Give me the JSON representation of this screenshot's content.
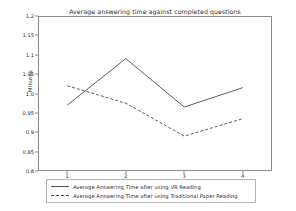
{
  "chart_data": {
    "type": "line",
    "title": "Average answering time against completed questions",
    "xlabel": "",
    "ylabel": "Minutes",
    "x": [
      1,
      2,
      3,
      4
    ],
    "categories": [
      "1",
      "2",
      "3",
      "4"
    ],
    "xtick_labels": [
      "1",
      "2",
      "3",
      "4"
    ],
    "ytick_labels": [
      "1.2",
      "1.15",
      "1.1",
      "1.05",
      "1.0",
      "0.95",
      "0.9",
      "0.85",
      "0.8"
    ],
    "ytick_values": [
      1.2,
      1.15,
      1.1,
      1.05,
      1.0,
      0.95,
      0.9,
      0.85,
      0.8
    ],
    "ylim": [
      0.8,
      1.2
    ],
    "xlim": [
      0.5,
      4.5
    ],
    "grid": false,
    "legend_position": "below-axes",
    "series": [
      {
        "name": "Average Answering Time after using VR Reading",
        "style": "solid",
        "color": "#4a4a4a",
        "values": [
          0.97,
          1.09,
          0.965,
          1.015
        ]
      },
      {
        "name": "Average Answering Time after using Traditional Paper Reading",
        "style": "dashed",
        "color": "#4a4a4a",
        "values": [
          1.02,
          0.975,
          0.89,
          0.935
        ]
      }
    ]
  }
}
